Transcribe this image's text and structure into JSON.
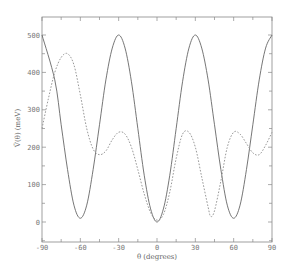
{
  "chart_data": {
    "type": "line",
    "title": "",
    "xlabel": "θ (degrees)",
    "ylabel": "V̄(θ) (meV)",
    "xlim": [
      -90,
      90
    ],
    "ylim": [
      -50,
      550
    ],
    "x_ticks": [
      -90,
      -60,
      -30,
      0,
      30,
      60,
      90
    ],
    "x_tick_labels": [
      "-90",
      "-60",
      "-30",
      "0",
      "30",
      "60",
      "90"
    ],
    "y_ticks": [
      0,
      100,
      200,
      300,
      400,
      500
    ],
    "y_tick_labels": [
      "0",
      "100",
      "200",
      "300",
      "400",
      "500"
    ],
    "grid": false,
    "legend": null,
    "series": [
      {
        "name": "solid",
        "style": "solid",
        "x": [
          -90,
          -80,
          -75,
          -70,
          -65,
          -60,
          -55,
          -50,
          -45,
          -40,
          -35,
          -30,
          -25,
          -20,
          -15,
          -10,
          -5,
          0,
          5,
          10,
          15,
          20,
          25,
          30,
          35,
          40,
          45,
          50,
          55,
          60,
          65,
          70,
          75,
          80,
          85,
          90
        ],
        "values": [
          500,
          380,
          260,
          140,
          45,
          10,
          45,
          140,
          260,
          380,
          465,
          500,
          465,
          375,
          250,
          125,
          35,
          0,
          35,
          125,
          250,
          375,
          465,
          500,
          465,
          380,
          260,
          140,
          45,
          10,
          45,
          140,
          260,
          380,
          465,
          500
        ]
      },
      {
        "name": "dashed",
        "style": "dashed",
        "x": [
          -90,
          -85,
          -80,
          -75,
          -70,
          -65,
          -60,
          -55,
          -50,
          -45,
          -40,
          -35,
          -30,
          -25,
          -20,
          -15,
          -10,
          -5,
          0,
          5,
          10,
          15,
          20,
          25,
          30,
          35,
          40,
          42,
          45,
          50,
          55,
          60,
          65,
          70,
          75,
          80,
          85,
          90
        ],
        "values": [
          250,
          330,
          400,
          440,
          450,
          420,
          340,
          250,
          195,
          180,
          190,
          220,
          240,
          235,
          200,
          140,
          75,
          25,
          5,
          20,
          80,
          170,
          235,
          240,
          200,
          120,
          40,
          15,
          30,
          110,
          200,
          240,
          235,
          210,
          185,
          180,
          205,
          240
        ]
      }
    ]
  }
}
